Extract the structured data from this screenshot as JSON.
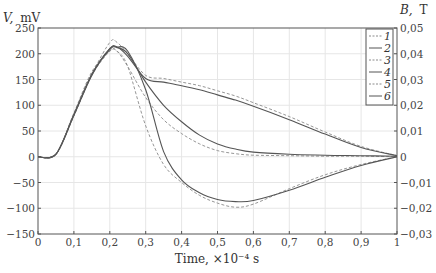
{
  "chart_data": {
    "type": "line",
    "title": "",
    "xlabel": "Time, ×10⁻⁴ s",
    "ylabel_left": "V, mV",
    "ylabel_right": "B, T",
    "xlim": [
      0,
      1
    ],
    "ylim_left": [
      -150,
      250
    ],
    "ylim_right": [
      -0.03,
      0.05
    ],
    "grid": true,
    "legend_position": "upper right",
    "x_ticks": [
      "0",
      "0,1",
      "0,2",
      "0,3",
      "0,4",
      "0,5",
      "0,6",
      "0,7",
      "0,8",
      "0,9",
      "1"
    ],
    "y_ticks_left": [
      "250",
      "200",
      "150",
      "100",
      "50",
      "0",
      "−50",
      "−100",
      "−150"
    ],
    "y_ticks_right": [
      "0,05",
      "0,04",
      "0,03",
      "0,02",
      "0,01",
      "0",
      "−0,01",
      "−0,02",
      "−0,03"
    ],
    "x": [
      0,
      0.05,
      0.1,
      0.15,
      0.2,
      0.22,
      0.25,
      0.3,
      0.35,
      0.4,
      0.45,
      0.5,
      0.55,
      0.6,
      0.7,
      0.8,
      0.9,
      1.0
    ],
    "series": [
      {
        "name": "1",
        "style": "dashed",
        "group": "upper",
        "values": [
          0,
          5,
          80,
          160,
          222,
          222,
          200,
          158,
          152,
          145,
          138,
          128,
          118,
          105,
          78,
          48,
          20,
          2
        ]
      },
      {
        "name": "2",
        "style": "solid",
        "group": "upper",
        "values": [
          0,
          5,
          82,
          160,
          210,
          213,
          195,
          152,
          145,
          138,
          130,
          120,
          110,
          98,
          72,
          44,
          18,
          2
        ]
      },
      {
        "name": "3",
        "style": "dashed",
        "group": "middle",
        "values": [
          0,
          5,
          85,
          165,
          205,
          205,
          175,
          115,
          72,
          45,
          25,
          12,
          6,
          3,
          2,
          1,
          1,
          0
        ]
      },
      {
        "name": "4",
        "style": "solid",
        "group": "middle",
        "values": [
          0,
          5,
          82,
          160,
          208,
          212,
          200,
          145,
          100,
          68,
          42,
          25,
          15,
          9,
          5,
          3,
          2,
          1
        ]
      },
      {
        "name": "5",
        "style": "dashed",
        "group": "lower",
        "values": [
          0,
          5,
          80,
          158,
          205,
          205,
          175,
          60,
          -15,
          -50,
          -75,
          -90,
          -98,
          -92,
          -62,
          -35,
          -15,
          0
        ]
      },
      {
        "name": "6",
        "style": "solid",
        "group": "lower",
        "values": [
          0,
          5,
          80,
          158,
          210,
          213,
          205,
          130,
          10,
          -45,
          -70,
          -83,
          -87,
          -85,
          -65,
          -40,
          -17,
          0
        ]
      }
    ]
  },
  "legend": {
    "items": [
      {
        "label": "1",
        "style": "dashed"
      },
      {
        "label": "2",
        "style": "solid"
      },
      {
        "label": "3",
        "style": "dashed"
      },
      {
        "label": "4",
        "style": "solid"
      },
      {
        "label": "5",
        "style": "dashed"
      },
      {
        "label": "6",
        "style": "solid"
      }
    ]
  },
  "axes": {
    "left_title_var": "V,",
    "left_title_unit": "mV",
    "right_title_var": "B,",
    "right_title_unit": "T",
    "x_title": "Time,  ×10⁻⁴ s"
  },
  "colors": {
    "axis": "#555555",
    "grid": "#e6e6e6",
    "solid_line": "#555555",
    "dashed_line": "#8a8a8a"
  }
}
